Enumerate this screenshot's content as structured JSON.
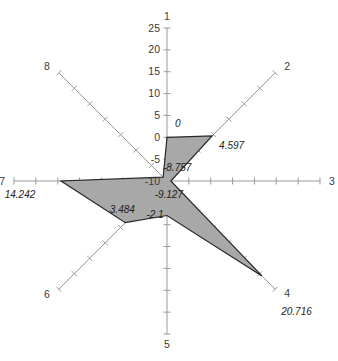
{
  "chart_data": {
    "type": "radar",
    "title": "",
    "subtitle": "",
    "xlabel": "",
    "ylabel": "",
    "grid": false,
    "legend": "none",
    "axis_count": 8,
    "radial_range": [
      -10,
      25
    ],
    "radial_tick_step": 5,
    "radial_tick_labels": [
      "25",
      "20",
      "15",
      "10",
      "5",
      "0",
      "-5",
      "-10"
    ],
    "radial_tick_values": [
      25,
      20,
      15,
      10,
      5,
      0,
      -5,
      -10
    ],
    "scale_axis": "1",
    "categories": [
      "1",
      "2",
      "3",
      "4",
      "5",
      "6",
      "7",
      "8"
    ],
    "values": [
      0,
      4.597,
      -9.127,
      20.716,
      -2.1,
      3.484,
      14.242,
      -8.757
    ],
    "value_labels": [
      "0",
      "4.597",
      "-9.127",
      "20.716",
      "-2.1",
      "3.484",
      "14.242",
      "-8.757"
    ],
    "axis_angles_deg": [
      90,
      45,
      0,
      -45,
      -90,
      -135,
      180,
      135
    ],
    "series": [
      {
        "name": "series-1",
        "values": [
          0,
          4.597,
          -9.127,
          20.716,
          -2.1,
          3.484,
          14.242,
          -8.757
        ],
        "fill_color": "#a8a8a8",
        "line_color": "#262626"
      }
    ]
  },
  "axes": [
    {
      "id": "1",
      "name_label": "1",
      "value_label": "0",
      "value": 0
    },
    {
      "id": "2",
      "name_label": "2",
      "value_label": "4.597",
      "value": 4.597
    },
    {
      "id": "3",
      "name_label": "3",
      "value_label": "-9.127",
      "value": -9.127
    },
    {
      "id": "4",
      "name_label": "4",
      "value_label": "20.716",
      "value": 20.716
    },
    {
      "id": "5",
      "name_label": "5",
      "value_label": "-2.1",
      "value": -2.1
    },
    {
      "id": "6",
      "name_label": "6",
      "value_label": "3.484",
      "value": 3.484
    },
    {
      "id": "7",
      "name_label": "7",
      "value_label": "14.242",
      "value": 14.242
    },
    {
      "id": "8",
      "name_label": "8",
      "value_label": "-8.757",
      "value": -8.757
    }
  ],
  "scale": {
    "labels": [
      "25",
      "20",
      "15",
      "10",
      "5",
      "0",
      "-5",
      "-10"
    ]
  },
  "colors": {
    "fill": "#a8a8a8",
    "outline": "#262626",
    "axis": "#9a9a9a",
    "text": "#3a3a3a",
    "background": "#ffffff"
  }
}
